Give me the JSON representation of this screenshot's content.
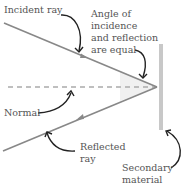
{
  "diagram": {
    "labels": {
      "incident_ray": "Incident ray",
      "angle_line1": "Angle of",
      "angle_line2": "incidence",
      "angle_line3": "and reflection",
      "angle_line4": "are equal",
      "normal": "Normal",
      "reflected_line1": "Reflected",
      "reflected_line2": "ray",
      "secondary_line1": "Secondary",
      "secondary_line2": "material"
    },
    "colors": {
      "ray": "#888888",
      "surface": "#c8c8c8",
      "normal": "#aaaaaa",
      "arrow": "#222222",
      "angle_fill": "#eeeeee"
    }
  }
}
